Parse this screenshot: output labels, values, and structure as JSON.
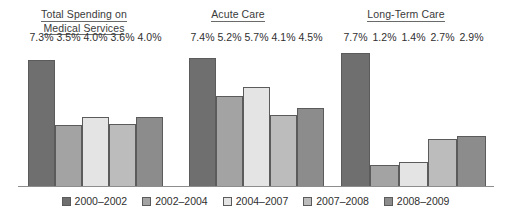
{
  "chart_data": {
    "type": "bar",
    "title": "",
    "xlabel": "",
    "ylabel": "",
    "ylim": [
      0,
      8.2
    ],
    "grid": false,
    "legend_position": "bottom",
    "value_suffix": "%",
    "categories": [
      "Total Spending on Medical Services",
      "Acute Care",
      "Long-Term Care"
    ],
    "group_titles": [
      {
        "line1": "Total Spending on",
        "line2": "Medical Services"
      },
      {
        "line1": "Acute Care",
        "line2": ""
      },
      {
        "line1": "Long-Term Care",
        "line2": ""
      }
    ],
    "series": [
      {
        "name": "2000–2002",
        "color": "#706f6f",
        "values": [
          7.3,
          7.4,
          7.7
        ],
        "labels": [
          "7.3%",
          "7.4%",
          "7.7%"
        ]
      },
      {
        "name": "2002–2004",
        "color": "#a3a3a3",
        "values": [
          3.5,
          5.2,
          1.2
        ],
        "labels": [
          "3.5%",
          "5.2%",
          "1.2%"
        ]
      },
      {
        "name": "2004–2007",
        "color": "#e4e4e4",
        "values": [
          4.0,
          5.7,
          1.4
        ],
        "labels": [
          "4.0%",
          "5.7%",
          "1.4%"
        ]
      },
      {
        "name": "2007–2008",
        "color": "#bcbcbc",
        "values": [
          3.6,
          4.1,
          2.7
        ],
        "labels": [
          "3.6%",
          "4.1%",
          "2.7%"
        ]
      },
      {
        "name": "2008–2009",
        "color": "#8c8c8c",
        "values": [
          4.0,
          4.5,
          2.9
        ],
        "labels": [
          "4.0%",
          "4.5%",
          "2.9%"
        ]
      }
    ],
    "legend": [
      {
        "label": "2000–2002",
        "color": "#706f6f"
      },
      {
        "label": "2002–2004",
        "color": "#a3a3a3"
      },
      {
        "label": "2004–2007",
        "color": "#e4e4e4"
      },
      {
        "label": "2007–2008",
        "color": "#bcbcbc"
      },
      {
        "label": "2008–2009",
        "color": "#8c8c8c"
      }
    ]
  },
  "layout": {
    "groups": [
      {
        "left": 28,
        "bar_width": 27,
        "title_left": 0,
        "title_width": 168,
        "title_top": 8
      },
      {
        "left": 189,
        "bar_width": 27,
        "title_left": 168,
        "title_width": 140,
        "title_top": 8
      },
      {
        "left": 341,
        "bar_width": 29,
        "title_left": 316,
        "title_width": 180,
        "title_top": 8
      }
    ],
    "plot_height": 142,
    "axis_max": 8.2
  }
}
